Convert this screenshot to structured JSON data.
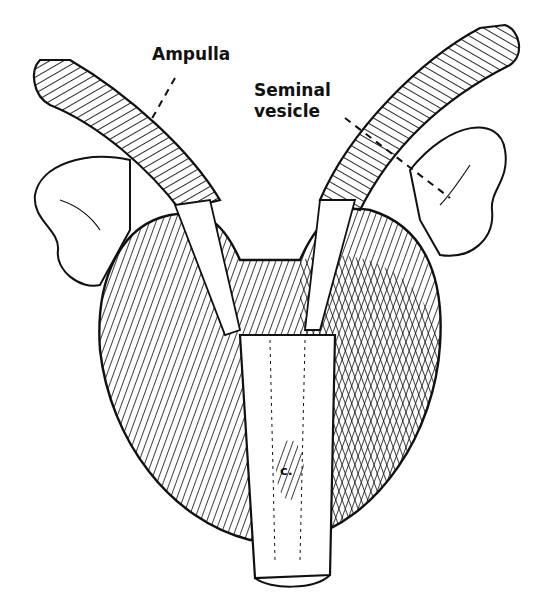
{
  "diagram": {
    "labels": {
      "ampulla": "Ampulla",
      "seminal_vesicle_line1": "Seminal",
      "seminal_vesicle_line2": "vesicle",
      "colliculus": "c."
    },
    "colors": {
      "ink": "#111111",
      "background": "#ffffff"
    }
  }
}
